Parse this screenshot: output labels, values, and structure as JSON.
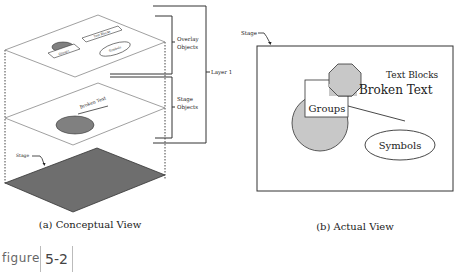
{
  "conceptual_view": {
    "caption": "(a) Conceptual View",
    "layers": [
      {
        "name": "overlay",
        "objects": [
          "Groups",
          "Text Blocks",
          "Symbols"
        ]
      },
      {
        "name": "stage-objects",
        "objects": [
          "Broken Text"
        ]
      },
      {
        "name": "stage",
        "label": "Stage"
      }
    ],
    "brackets": {
      "overlay": "Overlay Objects",
      "overlay_line1": "Overlay",
      "overlay_line2": "Objects",
      "stage_line1": "Stage",
      "stage_line2": "Objects",
      "layer": "Layer 1"
    },
    "top_labels": {
      "groups": "Groups",
      "text_blocks": "Text Blocks",
      "symbols": "Symbols"
    },
    "mid_labels": {
      "broken_text": "Broken Text"
    },
    "stage_label": "Stage"
  },
  "actual_view": {
    "caption": "(b) Actual View",
    "stage_label": "Stage",
    "text_blocks": "Text Blocks",
    "broken_text": "Broken Text",
    "groups": "Groups",
    "symbols": "Symbols"
  },
  "figure": {
    "label": "figure",
    "number": "5-2"
  },
  "colors": {
    "shape_fill": "#c8c8c8",
    "stage_fill": "#6e6e6e",
    "line": "#333333"
  }
}
